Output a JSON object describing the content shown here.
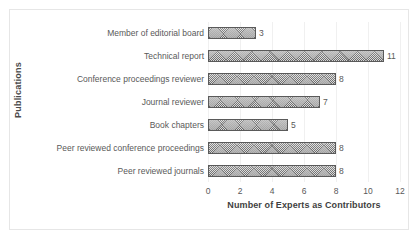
{
  "chart_data": {
    "type": "bar",
    "orientation": "horizontal",
    "title": "",
    "xlabel": "Number of Experts as Contributors",
    "ylabel": "Publications",
    "xlim": [
      0,
      12
    ],
    "xticks": [
      "0",
      "2",
      "4",
      "6",
      "8",
      "10",
      "12"
    ],
    "grid": true,
    "legend": null,
    "categories": [
      "Member of editorial board",
      "Technical report",
      "Conference proceedings reviewer",
      "Journal reviewer",
      "Book chapters",
      "Peer reviewed conference proceedings",
      "Peer reviewed journals"
    ],
    "values": [
      3,
      11,
      8,
      7,
      5,
      8,
      8
    ],
    "value_labels": [
      "3",
      "11",
      "8",
      "7",
      "5",
      "8",
      "8"
    ],
    "bar_color": "#8c8c8c",
    "bar_edge_color": "#5a5a5a",
    "text_color": "#595959",
    "frame_color": "#e6e6e6",
    "grid_color": "#f0f0f0"
  }
}
